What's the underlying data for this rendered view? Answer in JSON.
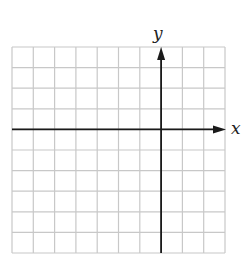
{
  "graph": {
    "x_label": "x",
    "y_label": "y",
    "grid": {
      "columns": 10,
      "rows": 10,
      "left": 12,
      "top": 47,
      "cell_width": 21.3,
      "cell_height": 20.6,
      "line_color": "#c8c8c8",
      "y_axis_column": 7,
      "x_axis_row": 4
    },
    "axis_color": "#1a1a1a"
  }
}
